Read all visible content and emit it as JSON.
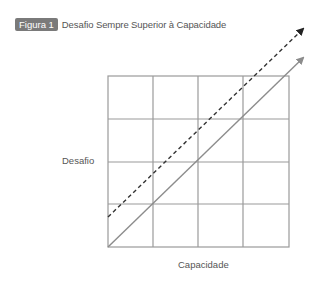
{
  "figure": {
    "badge": "Figura 1",
    "title": "Desafio Sempre Superior à Capacidade"
  },
  "axes": {
    "ylabel": "Desafio",
    "xlabel": "Capacidade"
  },
  "grid": {
    "rows": 4,
    "cols": 4,
    "color": "#9a9a9a"
  },
  "lines": [
    {
      "name": "capacidade-equals-desafio",
      "style": "solid",
      "color": "#8c8c8c"
    },
    {
      "name": "desafio-above-capacidade",
      "style": "dashed",
      "color": "#333333"
    }
  ]
}
